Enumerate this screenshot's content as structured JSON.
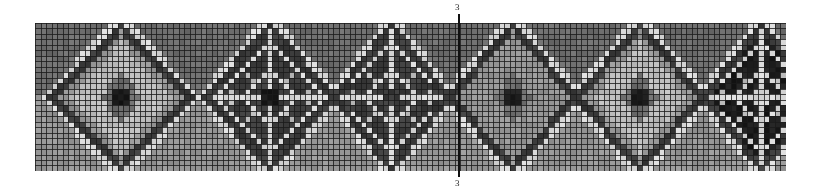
{
  "chart": {
    "title": "",
    "center_marker": {
      "top_label": "3",
      "bottom_label": "3"
    },
    "grid": {
      "cols": 136,
      "rows": 27,
      "cell_w": 5.52,
      "cell_h": 5.48,
      "line_color": "#1a1a1a",
      "background": "#8a8a8a"
    },
    "palette": {
      "white": "#d9d9d9",
      "light": "#bdbdbd",
      "mid": "#969696",
      "midDark": "#6e6e6e",
      "dark": "#3c3c3c",
      "black": "#1c1c1c"
    },
    "motifs": [
      {
        "type": "solid",
        "cx": 15,
        "cy": 13,
        "rx": 13,
        "ry": 14,
        "fill": "light",
        "center": "black",
        "border": "dark",
        "bandWidth": 2
      },
      {
        "type": "lattice",
        "cx": 42,
        "cy": 13,
        "rx": 12,
        "ry": 14,
        "fill": "dark",
        "center": "black",
        "border": "dark",
        "bandWidth": 2
      },
      {
        "type": "lattice",
        "cx": 64,
        "cy": 13,
        "rx": 11,
        "ry": 14,
        "fill": "dark",
        "center": "dark",
        "border": "dark",
        "bandWidth": 2
      },
      {
        "type": "solid",
        "cx": 86,
        "cy": 13,
        "rx": 12,
        "ry": 14,
        "fill": "mid",
        "center": "black",
        "border": "dark",
        "bandWidth": 2
      },
      {
        "type": "solid",
        "cx": 109,
        "cy": 13,
        "rx": 12,
        "ry": 14,
        "fill": "light",
        "center": "black",
        "border": "dark",
        "bandWidth": 2
      },
      {
        "type": "lattice",
        "cx": 131,
        "cy": 13,
        "rx": 11,
        "ry": 14,
        "fill": "black",
        "center": "white",
        "border": "dark",
        "bandWidth": 2
      }
    ],
    "gaps": {
      "topTriangle": "midDark",
      "bottomTriangle": "mid",
      "crossing": "white"
    }
  }
}
